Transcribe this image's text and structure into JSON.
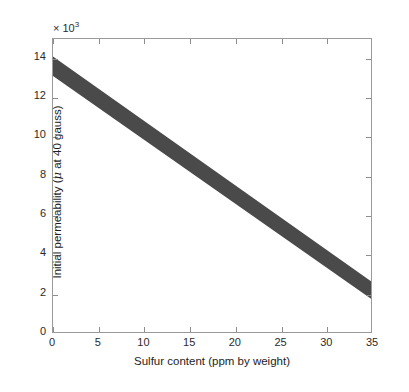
{
  "chart_data": {
    "type": "area",
    "title": "",
    "xlabel": "Sulfur content (ppm by weight)",
    "ylabel": "Initial permeability (μ at 40 gauss)",
    "y_multiplier_prefix": "× 10",
    "y_multiplier_exponent": "3",
    "xlim": [
      0,
      35
    ],
    "ylim": [
      0,
      15
    ],
    "xticks": [
      0,
      5,
      10,
      15,
      20,
      25,
      30,
      35
    ],
    "xtick_labels": [
      "0",
      "5",
      "10",
      "15",
      "20",
      "25",
      "30",
      "35"
    ],
    "yticks": [
      0,
      2,
      4,
      6,
      8,
      10,
      12,
      14
    ],
    "ytick_labels": [
      "0",
      "2",
      "4",
      "6",
      "8",
      "10",
      "12",
      "14"
    ],
    "grid": false,
    "legend": null,
    "series": [
      {
        "name": "Initial permeability band",
        "kind": "band",
        "color": "#4a4a4a",
        "x": [
          0,
          35
        ],
        "y_upper": [
          14.1,
          2.6
        ],
        "y_lower": [
          13.1,
          1.7
        ]
      }
    ]
  },
  "axes": {
    "x_title": "Sulfur content (ppm by weight)",
    "y_title_before_mu": "Initial permeability (",
    "y_title_mu": "μ",
    "y_title_after_mu": " at 40 gauss)",
    "multiplier_text": "× 10",
    "multiplier_exp": "3"
  },
  "style": {
    "band_color": "#4a4a4a",
    "axis_color": "#9a9a9a",
    "tick_color": "#8d8d8d",
    "text_color": "#2b2b2b",
    "background": "#ffffff"
  }
}
